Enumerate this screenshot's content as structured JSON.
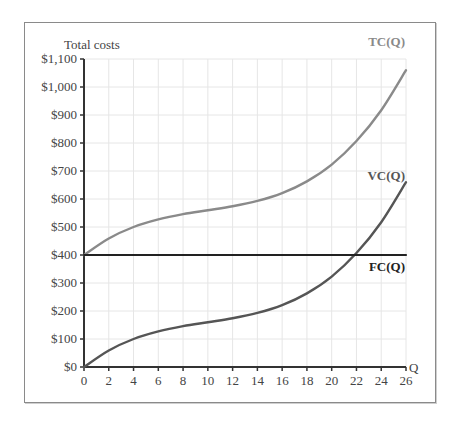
{
  "chart_data": {
    "type": "line",
    "title": "",
    "ylabel": "Total costs",
    "xlabel": "Q",
    "xlim": [
      0,
      26
    ],
    "ylim": [
      0,
      1100
    ],
    "grid": true,
    "x_ticks": [
      0,
      2,
      4,
      6,
      8,
      10,
      12,
      14,
      16,
      18,
      20,
      22,
      24,
      26
    ],
    "y_ticks": [
      0,
      100,
      200,
      300,
      400,
      500,
      600,
      700,
      800,
      900,
      1000,
      1100
    ],
    "y_tick_labels": [
      "$0",
      "$100",
      "$200",
      "$300",
      "$400",
      "$500",
      "$600",
      "$700",
      "$800",
      "$900",
      "$1,000",
      "$1,100"
    ],
    "x": [
      0,
      2,
      4,
      6,
      8,
      10,
      12,
      14,
      16,
      18,
      20,
      22,
      24,
      26
    ],
    "series": [
      {
        "name": "TC(Q)",
        "color": "#8a8a8a",
        "values": [
          400,
          459,
          500,
          527,
          546,
          560,
          574,
          593,
          621,
          663,
          723,
          807,
          917,
          1060
        ]
      },
      {
        "name": "VC(Q)",
        "color": "#555555",
        "values": [
          0,
          59,
          100,
          127,
          146,
          160,
          174,
          193,
          221,
          263,
          323,
          407,
          517,
          660
        ]
      },
      {
        "name": "FC(Q)",
        "color": "#222222",
        "values": [
          400,
          400,
          400,
          400,
          400,
          400,
          400,
          400,
          400,
          400,
          400,
          400,
          400,
          400
        ]
      }
    ],
    "annotations": [
      "TC(Q)",
      "VC(Q)",
      "FC(Q)"
    ],
    "legend": "inline labels at right end of each curve"
  },
  "labels": {
    "y_axis_title": "Total costs",
    "x_axis_title": "Q",
    "tc": "TC(Q)",
    "vc": "VC(Q)",
    "fc": "FC(Q)"
  }
}
